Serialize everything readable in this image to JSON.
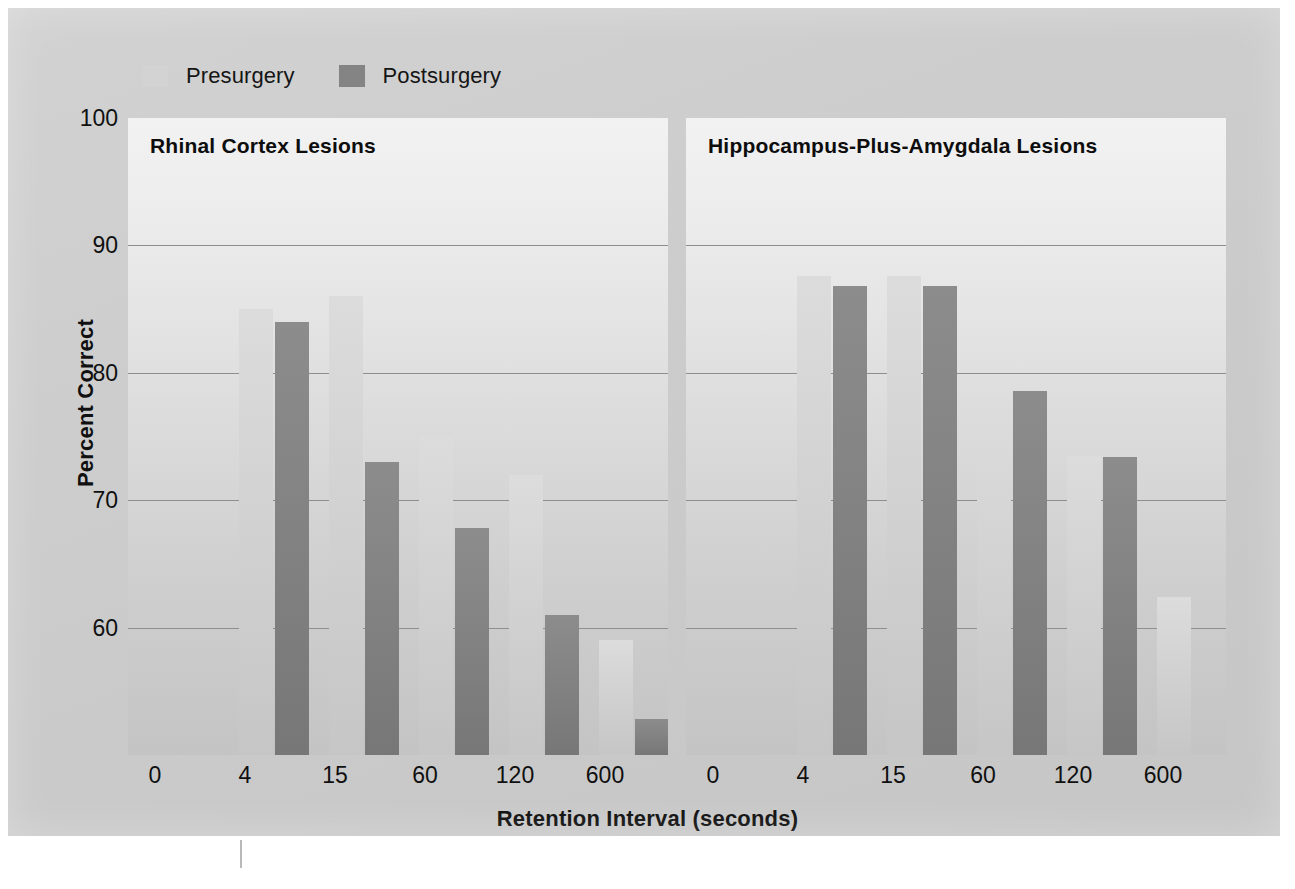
{
  "figure": {
    "ylabel": "Percent Correct",
    "xlabel": "Retention Interval (seconds)"
  },
  "legend": {
    "items": [
      {
        "label": "Presurgery",
        "color": "#d3d3d3",
        "icon": "legend-swatch"
      },
      {
        "label": "Postsurgery",
        "color": "#848484",
        "icon": "legend-swatch"
      }
    ]
  },
  "yaxis": {
    "ticks": [
      "100",
      "90",
      "80",
      "70",
      "60"
    ],
    "min": 50,
    "max": 100
  },
  "xaxis": {
    "ticks": [
      "0",
      "4",
      "15",
      "60",
      "120",
      "600"
    ]
  },
  "panels": [
    {
      "title": "Rhinal Cortex Lesions"
    },
    {
      "title": "Hippocampus-Plus-Amygdala Lesions"
    }
  ],
  "chart_data": {
    "type": "bar",
    "title": "",
    "subtitle": "",
    "xlabel": "Retention Interval (seconds)",
    "ylabel": "Percent Correct",
    "ylim": [
      50,
      100
    ],
    "yticks": [
      60,
      70,
      80,
      90,
      100
    ],
    "grid": "horizontal",
    "legend_position": "top-left",
    "categories": [
      "0",
      "4",
      "15",
      "60",
      "120",
      "600"
    ],
    "panels": [
      {
        "name": "Rhinal Cortex Lesions",
        "series": [
          {
            "name": "Presurgery",
            "color": "#d3d3d3",
            "values": [
              null,
              85,
              86,
              75,
              72,
              59
            ]
          },
          {
            "name": "Postsurgery",
            "color": "#848484",
            "values": [
              null,
              84,
              73,
              67.8,
              61,
              52.8
            ]
          }
        ]
      },
      {
        "name": "Hippocampus-Plus-Amygdala Lesions",
        "series": [
          {
            "name": "Presurgery",
            "color": "#d3d3d3",
            "values": [
              null,
              87.6,
              87.6,
              76.8,
              73.5,
              62.4
            ]
          },
          {
            "name": "Postsurgery",
            "color": "#848484",
            "values": [
              null,
              86.8,
              86.8,
              78.6,
              73.4,
              null
            ]
          }
        ]
      }
    ],
    "note": "First category (0 s) has no plotted bars; bars are drawn in the five intervals 4, 15, 60, 120, 600."
  }
}
